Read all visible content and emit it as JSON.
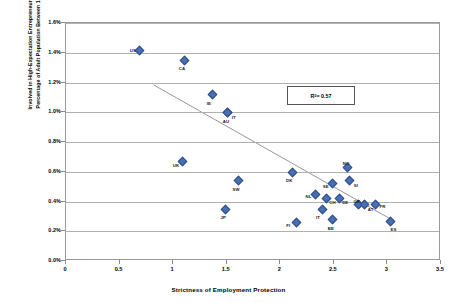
{
  "chart_data": {
    "type": "scatter",
    "title": "",
    "xlabel": "Strictness of Employment Protection",
    "ylabel_lines": [
      "Involved in High-Expectation Entrepreneurship (HEA)",
      "Percentage of Adult Population Between 18-64 Years"
    ],
    "ylabel": "Involved in High-Expectation Entrepreneurship (HEA) Percentage of Adult Population Between 18-64 Years",
    "xlim": [
      0,
      3.5
    ],
    "ylim": [
      0,
      1.6
    ],
    "xticks": [
      "0",
      "0.5",
      "1",
      "1.5",
      "2",
      "2.5",
      "3",
      "3.5"
    ],
    "xtick_values": [
      0,
      0.5,
      1,
      1.5,
      2,
      2.5,
      3,
      3.5
    ],
    "yticks": [
      "0.0%",
      "0.2%",
      "0.4%",
      "0.6%",
      "0.8%",
      "1.0%",
      "1.2%",
      "1.4%",
      "1.6%"
    ],
    "ytick_values": [
      0,
      0.2,
      0.4,
      0.6,
      0.8,
      1.0,
      1.2,
      1.4,
      1.6
    ],
    "grid": true,
    "grid_axis": "y",
    "legend": false,
    "marker_color": "#4a6fb0",
    "trendline_color": "#8a8a8a",
    "annotation": {
      "text": "R² = 0.57",
      "label": "R",
      "sup": "2",
      "value": " = 0.57"
    },
    "trendline": {
      "x0": 0.82,
      "y0": 1.18,
      "x1": 3.04,
      "y1": 0.275
    },
    "points": [
      {
        "label": "US",
        "x": 0.68,
        "y": 1.425,
        "lx": -9,
        "ly": -1
      },
      {
        "label": "CA",
        "x": 1.1,
        "y": 1.355,
        "lx": -5,
        "ly": 7
      },
      {
        "label": "IE",
        "x": 1.36,
        "y": 1.125,
        "lx": -5,
        "ly": 7
      },
      {
        "label": "IT",
        "x": 1.5,
        "y": 1.005,
        "lx": 5,
        "ly": 3
      },
      {
        "label": "AU",
        "x": 1.5,
        "y": 1.005,
        "lx": -4,
        "ly": 7
      },
      {
        "label": "UK",
        "x": 1.08,
        "y": 0.675,
        "lx": -9,
        "ly": 2
      },
      {
        "label": "SW",
        "x": 1.6,
        "y": 0.545,
        "lx": -5,
        "ly": 7
      },
      {
        "label": "DK",
        "x": 2.1,
        "y": 0.605,
        "lx": -5,
        "ly": 7
      },
      {
        "label": "NO",
        "x": 2.62,
        "y": 0.635,
        "lx": -4,
        "ly": -6
      },
      {
        "label": "SE",
        "x": 2.48,
        "y": 0.525,
        "lx": -9,
        "ly": 1
      },
      {
        "label": "SI",
        "x": 2.64,
        "y": 0.545,
        "lx": 5,
        "ly": 3
      },
      {
        "label": "NL",
        "x": 2.32,
        "y": 0.455,
        "lx": -9,
        "ly": 1
      },
      {
        "label": "CH",
        "x": 2.42,
        "y": 0.425,
        "lx": 4,
        "ly": 2
      },
      {
        "label": "DE",
        "x": 2.54,
        "y": 0.425,
        "lx": 4,
        "ly": 2
      },
      {
        "label": "GR",
        "x": 2.72,
        "y": 0.385,
        "lx": -4,
        "ly": -5
      },
      {
        "label": "AT",
        "x": 2.78,
        "y": 0.385,
        "lx": 4,
        "ly": 3
      },
      {
        "label": "FR",
        "x": 2.88,
        "y": 0.385,
        "lx": 5,
        "ly": 0
      },
      {
        "label": "IT2",
        "x": 2.38,
        "y": 0.355,
        "lx": -5,
        "ly": 7
      },
      {
        "label": "BE",
        "x": 2.48,
        "y": 0.285,
        "lx": -4,
        "ly": 7
      },
      {
        "label": "FI",
        "x": 2.14,
        "y": 0.265,
        "lx": -9,
        "ly": 1
      },
      {
        "label": "JP",
        "x": 1.48,
        "y": 0.355,
        "lx": -4,
        "ly": 7
      },
      {
        "label": "ES",
        "x": 3.02,
        "y": 0.275,
        "lx": 1,
        "ly": 7
      }
    ]
  }
}
